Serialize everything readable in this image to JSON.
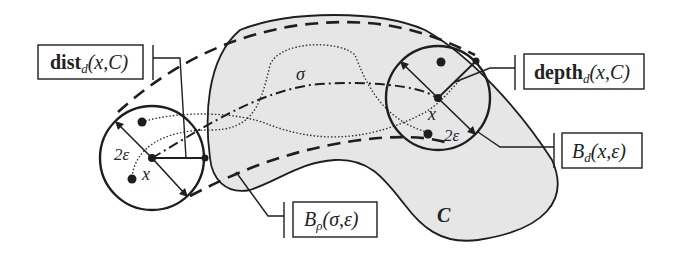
{
  "figure": {
    "region_label": "C",
    "path_label": "σ",
    "left_point_label": "x",
    "right_point_label": "x",
    "left_radius_label": "2ε",
    "right_radius_label": "2ε",
    "callouts": {
      "dist": {
        "bold": "dist",
        "sub": "d",
        "args": "(x,C)"
      },
      "depth": {
        "bold": "depth",
        "sub": "d",
        "args": "(x,C)"
      },
      "ball_d": {
        "main": "B",
        "sub": "d",
        "args": "(x,ε)"
      },
      "ball_rho": {
        "main": "B",
        "sub": "ρ",
        "args": "(σ,ε)"
      }
    },
    "colors": {
      "region_fill": "#e6e6e6",
      "stroke": "#1e1e1e",
      "background": "#ffffff"
    }
  }
}
